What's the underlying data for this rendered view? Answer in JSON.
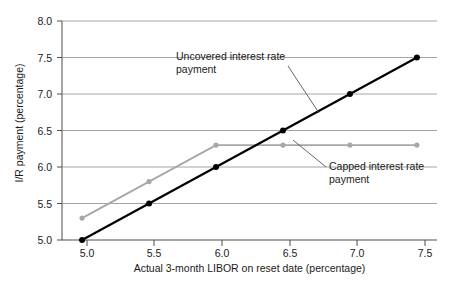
{
  "chart_data": {
    "type": "line",
    "title": "",
    "xlabel": "Actual 3-month LIBOR on reset date (percentage)",
    "ylabel": "I/R payment (percentage)",
    "xlim": [
      4.85,
      7.65
    ],
    "ylim": [
      5.0,
      8.0
    ],
    "xticks": [
      "5.0",
      "5.5",
      "6.0",
      "6.5",
      "7.0",
      "7.5"
    ],
    "xtick_values": [
      5.0,
      5.5,
      6.0,
      6.5,
      7.0,
      7.5
    ],
    "yticks": [
      "5.0",
      "5.5",
      "6.0",
      "6.5",
      "7.0",
      "7.5",
      "8.0"
    ],
    "ytick_values": [
      5.0,
      5.5,
      6.0,
      6.5,
      7.0,
      7.5,
      8.0
    ],
    "grid": true,
    "grid_axis": "y",
    "legend": "annotations",
    "x": [
      5.0,
      5.5,
      6.0,
      6.5,
      7.0,
      7.5
    ],
    "series": [
      {
        "name": "Uncovered interest rate payment",
        "values": [
          5.0,
          5.5,
          6.0,
          6.5,
          7.0,
          7.5
        ],
        "color": "#000000",
        "marker": "circle",
        "linewidth": 2.2
      },
      {
        "name": "Capped interest rate payment",
        "values": [
          5.3,
          5.8,
          6.3,
          6.3,
          6.3,
          6.3
        ],
        "color": "#a8a8a8",
        "marker": "circle",
        "linewidth": 1.8
      }
    ],
    "annotations": [
      {
        "id": "uncovered",
        "text": "Uncovered interest rate payment",
        "text_x": 176,
        "text_y": 52,
        "leader_from_x": 288,
        "leader_from_y": 66,
        "leader_to_x": 319,
        "leader_to_y": 113
      },
      {
        "id": "capped",
        "text": "Capped interest rate payment",
        "text_x": 328,
        "text_y": 162,
        "leader_from_x": 326,
        "leader_from_y": 167,
        "leader_to_x": 293,
        "leader_to_y": 140
      }
    ],
    "colors": {
      "axis": "#4d4d4d",
      "gridline": "#9a9a9a",
      "uncovered": "#000000",
      "capped": "#a8a8a8",
      "text": "#1a1a1a",
      "background": "#ffffff"
    }
  },
  "axes": {
    "y_tick_0": "5.0",
    "y_tick_1": "5.5",
    "y_tick_2": "6.0",
    "y_tick_3": "6.5",
    "y_tick_4": "7.0",
    "y_tick_5": "7.5",
    "y_tick_6": "8.0",
    "x_tick_0": "5.0",
    "x_tick_1": "5.5",
    "x_tick_2": "6.0",
    "x_tick_3": "6.5",
    "x_tick_4": "7.0",
    "x_tick_5": "7.5",
    "x_axis_title": "Actual 3-month LIBOR on reset date (percentage)",
    "y_axis_title": "I/R payment (percentage)"
  },
  "labels": {
    "uncovered_line1": "Uncovered interest rate",
    "uncovered_line2": "payment",
    "capped_line1": "Capped interest rate",
    "capped_line2": "payment"
  }
}
